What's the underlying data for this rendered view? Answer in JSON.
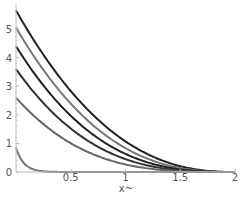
{
  "chart_data": {
    "type": "line",
    "title": "",
    "xlabel": "x~",
    "ylabel": "",
    "xlim": [
      0,
      2
    ],
    "ylim": [
      0,
      5.8
    ],
    "grid": false,
    "legend": "none",
    "x_ticks": [
      "0.5",
      "1",
      "1.5",
      "2"
    ],
    "x_tick_values": [
      0.5,
      1,
      1.5,
      2
    ],
    "y_ticks": [
      "0",
      "1",
      "2",
      "3",
      "4",
      "5"
    ],
    "y_tick_values": [
      0,
      1,
      2,
      3,
      4,
      5
    ],
    "series": [
      {
        "name": "curve-1",
        "color": "#222222",
        "start": 5.65,
        "exponent": 2.4,
        "x": [
          0,
          0.25,
          0.5,
          0.75,
          1,
          1.25,
          1.5,
          1.75,
          2
        ],
        "values": [
          5.65,
          4.2,
          3.2,
          2.0,
          1.1,
          0.55,
          0.2,
          0.05,
          0
        ]
      },
      {
        "name": "curve-2",
        "color": "#777777",
        "start": 5.05,
        "exponent": 2.6,
        "x": [
          0,
          0.25,
          0.5,
          0.75,
          1,
          1.25,
          1.5,
          1.75,
          2
        ],
        "values": [
          5.05,
          3.6,
          2.6,
          1.6,
          0.85,
          0.4,
          0.13,
          0.03,
          0
        ]
      },
      {
        "name": "curve-3",
        "color": "#222222",
        "start": 4.4,
        "exponent": 2.8,
        "x": [
          0,
          0.25,
          0.5,
          0.75,
          1,
          1.25,
          1.5,
          1.75,
          2
        ],
        "values": [
          4.4,
          3.0,
          2.1,
          1.2,
          0.65,
          0.28,
          0.09,
          0.02,
          0
        ]
      },
      {
        "name": "curve-4",
        "color": "#333333",
        "start": 3.6,
        "exponent": 3.0,
        "x": [
          0,
          0.25,
          0.5,
          0.75,
          1,
          1.25,
          1.5,
          1.75,
          2
        ],
        "values": [
          3.6,
          2.4,
          1.5,
          0.85,
          0.45,
          0.19,
          0.06,
          0.01,
          0
        ]
      },
      {
        "name": "curve-5",
        "color": "#666666",
        "start": 2.6,
        "exponent": 3.3,
        "x": [
          0,
          0.25,
          0.5,
          0.75,
          1,
          1.25,
          1.5,
          1.75,
          2
        ],
        "values": [
          2.6,
          1.7,
          1.0,
          0.55,
          0.27,
          0.1,
          0.03,
          0.0,
          0
        ]
      },
      {
        "name": "curve-6",
        "color": "#777777",
        "start": 0.85,
        "exponent": 30,
        "x": [
          0,
          0.05,
          0.1,
          0.15,
          0.2,
          0.3,
          2
        ],
        "values": [
          0.85,
          0.5,
          0.25,
          0.1,
          0.03,
          0,
          0
        ]
      }
    ]
  },
  "axes": {
    "x_label": "x~",
    "x_ticks": [
      "0.5",
      "1",
      "1.5",
      "2"
    ],
    "y_ticks": [
      "0",
      "1",
      "2",
      "3",
      "4",
      "5"
    ]
  }
}
